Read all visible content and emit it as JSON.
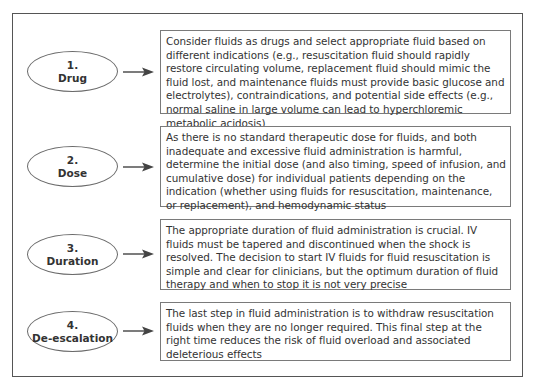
{
  "diagram": {
    "type": "flow-steps",
    "steps": [
      {
        "number": "1.",
        "title": "Drug",
        "description": "Consider fluids as drugs and select appropriate fluid based on different indications (e.g., resuscitation fluid should rapidly restore circulating volume, replacement fluid should mimic the fluid lost, and maintenance fluids must provide basic glucose and electrolytes), contraindications, and potential side effects (e.g., normal saline in large volume can lead to hyperchloremic metabolic acidosis)"
      },
      {
        "number": "2.",
        "title": "Dose",
        "description": "As there is no standard therapeutic dose for fluids, and both inadequate and excessive fluid administration is harmful, determine the initial dose (and also timing, speed of infusion, and cumulative dose) for individual patients depending on the indication (whether using fluids for resuscitation, maintenance, or replacement), and hemodynamic status"
      },
      {
        "number": "3.",
        "title": "Duration",
        "description": "The appropriate duration of fluid administration is crucial. IV fluids must be tapered and discontinued when the shock is resolved. The decision to start IV fluids for fluid resuscitation is simple and clear for clinicians, but the optimum duration of fluid therapy and when to stop it is not very precise"
      },
      {
        "number": "4.",
        "title": "De-escalation",
        "description": "The last step in fluid administration is to withdraw resuscitation fluids when they are no longer required. This final step at the right time reduces the risk of fluid overload and associated deleterious effects"
      }
    ],
    "colors": {
      "border": "#7a7a7a",
      "frame": "#555555",
      "text": "#333333",
      "arrow": "#444444"
    }
  }
}
